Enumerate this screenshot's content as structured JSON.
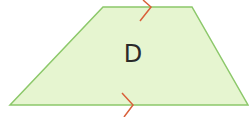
{
  "diagram": {
    "shape": "trapezoid",
    "label": "D",
    "fill_color": "#e6f5d0",
    "stroke_color": "#8cc86a",
    "arrow_color": "#d9603a",
    "vertices": [
      [
        103,
        7
      ],
      [
        192,
        7
      ],
      [
        248,
        105
      ],
      [
        10,
        105
      ]
    ],
    "parallel_marks": [
      {
        "side": "top",
        "x": 150,
        "y": 7
      },
      {
        "side": "bottom",
        "x": 132,
        "y": 105
      }
    ]
  }
}
